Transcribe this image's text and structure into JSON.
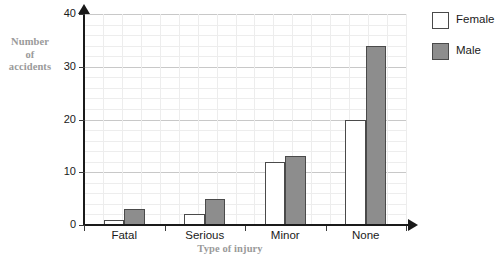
{
  "chart_data": {
    "type": "bar",
    "title": "",
    "xlabel": "Type of injury",
    "ylabel": "Number of accidents",
    "categories": [
      "Fatal",
      "Serious",
      "Minor",
      "None"
    ],
    "series": [
      {
        "name": "Female",
        "values": [
          1,
          2,
          12,
          20
        ],
        "color": "#ffffff"
      },
      {
        "name": "Male",
        "values": [
          3,
          5,
          13,
          34
        ],
        "color": "#8d8d8d"
      }
    ],
    "ylim": [
      0,
      40
    ],
    "yticks": [
      0,
      10,
      20,
      30,
      40
    ],
    "ytick_labels": [
      "0",
      "10",
      "20",
      "30",
      "40"
    ],
    "y_minor_step": 2,
    "grid": true,
    "legend_position": "right"
  },
  "axis": {
    "y_title_lines": [
      "Number",
      "of",
      "accidents"
    ],
    "y_title_line_1": "Number",
    "y_title_line_2": "of",
    "y_title_line_3": "accidents",
    "x_title": "Type of injury",
    "y_ticks": [
      "40",
      "30",
      "20",
      "10",
      "0"
    ],
    "x_ticks": [
      "Fatal",
      "Serious",
      "Minor",
      "None"
    ]
  },
  "legend": {
    "items": [
      {
        "label": "Female",
        "swatch": "white-square"
      },
      {
        "label": "Male",
        "swatch": "gray-square"
      }
    ]
  },
  "colors": {
    "female_fill": "#ffffff",
    "male_fill": "#8d8d8d",
    "bar_border": "#4a4a4a",
    "axis": "#1a1a1a",
    "grid_minor": "#ededed",
    "grid_major": "#c8c8c8",
    "title_text": "#9a9a9a"
  }
}
